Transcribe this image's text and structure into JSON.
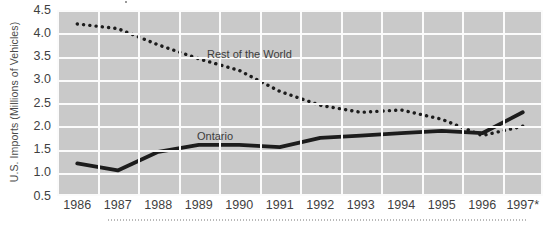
{
  "chart_data": {
    "type": "line",
    "title": "",
    "xlabel": "",
    "ylabel": "U.S. Imports (Millions of Vehicles)",
    "categories": [
      "1986",
      "1987",
      "1988",
      "1989",
      "1990",
      "1991",
      "1992",
      "1993",
      "1994",
      "1995",
      "1996",
      "1997*"
    ],
    "ylim": [
      0.5,
      4.5
    ],
    "yticks": [
      "0.5",
      "1.0",
      "1.5",
      "2.0",
      "2.5",
      "3.0",
      "3.5",
      "4.0",
      "4.5"
    ],
    "grid": true,
    "legend_position": "inline-annotation",
    "series": [
      {
        "name": "Rest of the World",
        "style": "dotted",
        "color": "#1c1c1c",
        "values": [
          4.2,
          4.1,
          3.75,
          3.45,
          3.2,
          2.75,
          2.45,
          2.3,
          2.35,
          2.15,
          1.8,
          2.0
        ]
      },
      {
        "name": "Ontario",
        "style": "solid",
        "color": "#1c1c1c",
        "values": [
          1.2,
          1.05,
          1.45,
          1.6,
          1.6,
          1.55,
          1.75,
          1.8,
          1.85,
          1.9,
          1.85,
          2.3
        ]
      }
    ],
    "annotations": [
      {
        "text": "Rest of the World",
        "series": "Rest of the World"
      },
      {
        "text": "Ontario",
        "series": "Ontario"
      }
    ],
    "colors": {
      "plot_background": "#c9c9c9",
      "gridline": "#fbfbfb",
      "line": "#1c1c1c",
      "text": "#3f3f3f",
      "page_background": "#ffffff"
    }
  }
}
